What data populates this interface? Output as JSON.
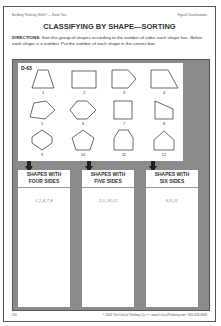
{
  "header": {
    "left": "Building Thinking Skills® — Book Two",
    "right": "Figural Classifications"
  },
  "title": "CLASSIFYING BY SHAPE—SORTING",
  "directions": {
    "label": "DIRECTIONS:",
    "text": " Sort this group of shapes according to the number of sides each shape has. Below each shape is a number. Put the number of each shape in the correct box."
  },
  "exercise_id": "D-63",
  "shapes": [
    {
      "number": "1",
      "type": "trapezoid"
    },
    {
      "number": "2",
      "type": "rectangle"
    },
    {
      "number": "3",
      "type": "pentagon-arrow"
    },
    {
      "number": "4",
      "type": "right-trapezoid"
    },
    {
      "number": "5",
      "type": "pentagon"
    },
    {
      "number": "6",
      "type": "hexagon"
    },
    {
      "number": "7",
      "type": "square"
    },
    {
      "number": "8",
      "type": "quadrilateral"
    },
    {
      "number": "9",
      "type": "hexagon-tall"
    },
    {
      "number": "10",
      "type": "pentagon-regular"
    },
    {
      "number": "11",
      "type": "hexagon-house"
    },
    {
      "number": "12",
      "type": "pentagon-house"
    }
  ],
  "categories": [
    {
      "label_line1": "SHAPES WITH",
      "label_line2": "FOUR SIDES",
      "answer": "1,2,4,7,8"
    },
    {
      "label_line1": "SHAPES WITH",
      "label_line2": "FIVE SIDES",
      "answer": "3,5,10,12"
    },
    {
      "label_line1": "SHAPES WITH",
      "label_line2": "SIX SIDES",
      "answer": "6,9,11"
    }
  ],
  "footer": {
    "page": "110",
    "text": "© 2006 The Critical Thinking Co.™ • www.CriticalThinking.com • 800-458-4849"
  },
  "colors": {
    "panel": "#8a8a8a",
    "arrow": "#222222"
  }
}
